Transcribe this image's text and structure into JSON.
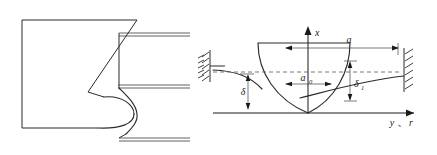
{
  "figure": {
    "title": "",
    "panels": [
      {
        "id": "left-panel",
        "name": "punch-cross-section-panel",
        "description": "cross-section outline of indenter block with S-shaped profile and two horizontal plate lines"
      },
      {
        "id": "right-panel",
        "name": "deflection-diagram-panel",
        "description": "axisymmetric contact deflection diagram with fixed supports at both ends"
      }
    ]
  },
  "axes": {
    "vertical_label": "x",
    "horizontal_label_1": "y",
    "horizontal_separator": "、",
    "horizontal_label_2": "r"
  },
  "dimensions": {
    "a": "a",
    "a_zero_base": "a",
    "a_zero_sub": "0",
    "delta": "δ",
    "delta_one_base": "δ",
    "delta_one_sub": "1"
  },
  "colors": {
    "line": "#2b2b2b",
    "dim_line": "#444444",
    "dashed_line": "#555555",
    "background": "#ffffff",
    "text": "#1a1a1a"
  },
  "supports": {
    "left_support_name": "fixed-support-left",
    "right_support_name": "fixed-support-right",
    "hatch_count": 5
  }
}
